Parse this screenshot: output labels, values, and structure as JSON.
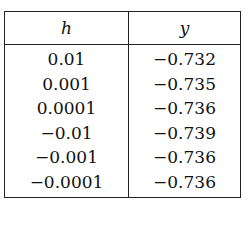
{
  "table": {
    "headers": [
      "h",
      "y"
    ],
    "rows": [
      {
        "h": "0.01",
        "y": "−0.732"
      },
      {
        "h": "0.001",
        "y": "−0.735"
      },
      {
        "h": "0.0001",
        "y": "−0.736"
      },
      {
        "h": "−0.01",
        "y": "−0.739"
      },
      {
        "h": "−0.001",
        "y": "−0.736"
      },
      {
        "h": "−0.0001",
        "y": "−0.736"
      }
    ]
  }
}
